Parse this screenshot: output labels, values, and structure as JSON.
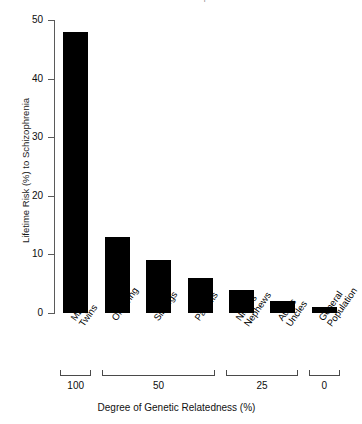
{
  "chart_data": {
    "type": "bar",
    "title": "Overall Risk of Schizophrenia",
    "xlabel": "Degree of Genetic Relatedness (%)",
    "ylabel": "Lifetime Risk (%) to Schizophrenia",
    "categories": [
      "MZ Twins",
      "Offspring",
      "Siblings",
      "Parents",
      "Nieces Nephews",
      "Aunts Uncles",
      "General Population"
    ],
    "category_lines": [
      [
        "MZ",
        "Twins"
      ],
      [
        "Offspring",
        ""
      ],
      [
        "Siblings",
        ""
      ],
      [
        "Parents",
        ""
      ],
      [
        "Nieces",
        "Nephews"
      ],
      [
        "Aunts",
        "Uncles"
      ],
      [
        "General",
        "Population"
      ]
    ],
    "values": [
      48,
      13,
      9,
      6,
      4,
      2,
      1
    ],
    "ylim": [
      0,
      50
    ],
    "yticks": [
      0,
      10,
      20,
      30,
      40,
      50
    ],
    "ytick_labels": [
      "0",
      "10",
      "20",
      "30",
      "40",
      "50"
    ],
    "grid": false,
    "legend": "none",
    "bar_color": "#000000",
    "relatedness_groups": [
      {
        "label": "100",
        "categories": [
          "MZ Twins"
        ]
      },
      {
        "label": "50",
        "categories": [
          "Offspring",
          "Siblings",
          "Parents"
        ]
      },
      {
        "label": "25",
        "categories": [
          "Nieces Nephews",
          "Aunts Uncles"
        ]
      },
      {
        "label": "0",
        "categories": [
          "General Population"
        ]
      }
    ],
    "relatedness_labels": [
      "100",
      "50",
      "25",
      "0"
    ]
  }
}
